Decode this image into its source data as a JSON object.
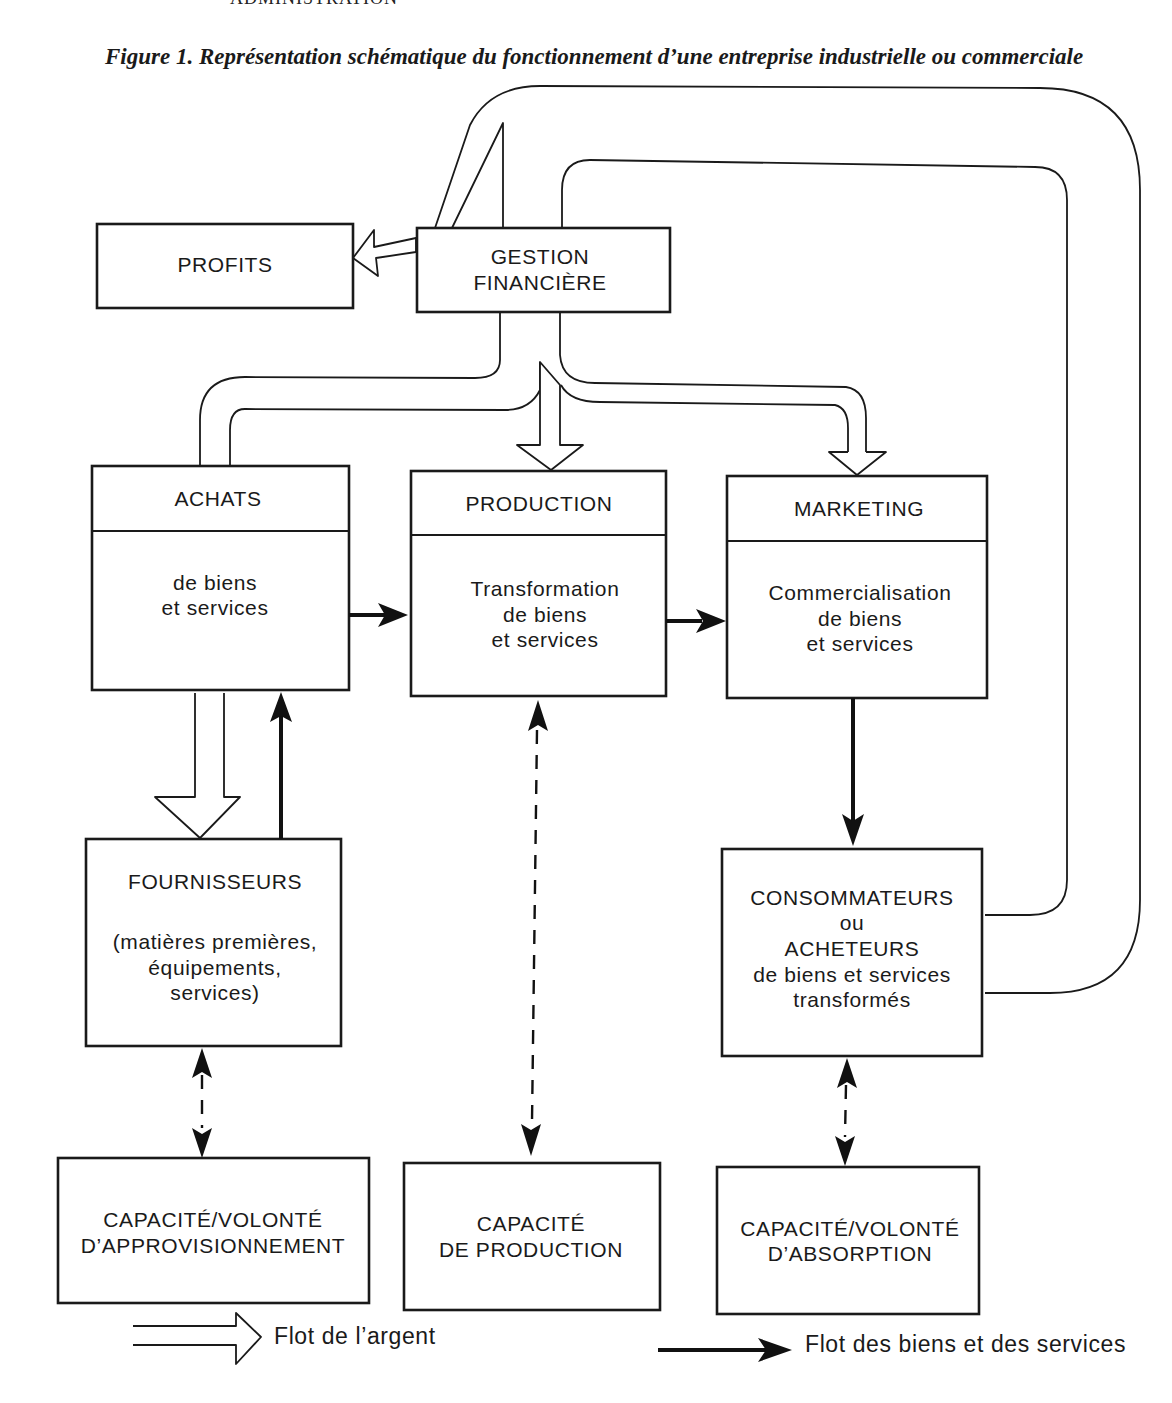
{
  "page": {
    "running_header": "ADMINISTRATION"
  },
  "figure": {
    "caption": "Figure 1. Représentation schématique du fonctionnement d’une entreprise industrielle ou commerciale"
  },
  "boxes": {
    "profits": {
      "title": "PROFITS"
    },
    "gestion": {
      "line1": "GESTION",
      "line2": "FINANCIÈRE"
    },
    "achats": {
      "title": "ACHATS",
      "body": [
        "de biens",
        "et services"
      ]
    },
    "production": {
      "title": "PRODUCTION",
      "body": [
        "Transformation",
        "de biens",
        "et services"
      ]
    },
    "marketing": {
      "title": "MARKETING",
      "body": [
        "Commercialisation",
        "de biens",
        "et services"
      ]
    },
    "fournisseurs": {
      "title": "FOURNISSEURS",
      "body": [
        "(matières premières,",
        "équipements,",
        "services)"
      ]
    },
    "consommateurs": {
      "lines": [
        "CONSOMMATEURS",
        "ou",
        "ACHETEURS",
        "de biens et services",
        "transformés"
      ]
    },
    "cap_approvisionnement": {
      "lines": [
        "CAPACITÉ/VOLONTÉ",
        "D’APPROVISIONNEMENT"
      ]
    },
    "cap_production": {
      "lines": [
        "CAPACITÉ",
        "DE PRODUCTION"
      ]
    },
    "cap_absorption": {
      "lines": [
        "CAPACITÉ/VOLONTÉ",
        "D’ABSORPTION"
      ]
    }
  },
  "legend": {
    "money_flow": "Flot de l’argent",
    "goods_flow": "Flot des biens et des services"
  },
  "colors": {
    "ink": "#1a1a1a",
    "paper": "#ffffff"
  }
}
